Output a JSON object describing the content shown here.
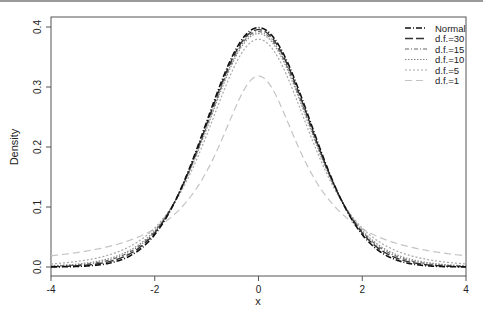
{
  "chart_data": {
    "type": "line",
    "title": "",
    "xlabel": "x",
    "ylabel": "Density",
    "xlim": [
      -4,
      4
    ],
    "ylim": [
      0,
      0.4
    ],
    "x_ticks": [
      "-4",
      "-2",
      "0",
      "2",
      "4"
    ],
    "y_ticks": [
      "0.0",
      "0.1",
      "0.2",
      "0.3",
      "0.4"
    ],
    "grid": false,
    "legend_position": "top-right",
    "series": [
      {
        "name": "Normal",
        "df": null,
        "color": "#111111",
        "dash": "6,2,1,2",
        "width": 1.6,
        "peak": 0.399
      },
      {
        "name": "d.f.=30",
        "df": 30,
        "color": "#333333",
        "dash": "8,3",
        "width": 1.4,
        "peak": 0.396
      },
      {
        "name": "d.f.=15",
        "df": 15,
        "color": "#666666",
        "dash": "4,2,1,2",
        "width": 1.2,
        "peak": 0.393
      },
      {
        "name": "d.f.=10",
        "df": 10,
        "color": "#888888",
        "dash": "1.5,1.5",
        "width": 1.2,
        "peak": 0.389
      },
      {
        "name": "d.f.=5",
        "df": 5,
        "color": "#a8a8a8",
        "dash": "2,2",
        "width": 1.2,
        "peak": 0.38
      },
      {
        "name": "d.f.=1",
        "df": 1,
        "color": "#c4c4c4",
        "dash": "7,4",
        "width": 1.2,
        "peak": 0.318
      }
    ]
  },
  "legend": {
    "items": [
      "Normal",
      "d.f.=30",
      "d.f.=15",
      "d.f.=10",
      "d.f.=5",
      "d.f.=1"
    ]
  },
  "axes": {
    "xlabel": "x",
    "ylabel": "Density"
  }
}
